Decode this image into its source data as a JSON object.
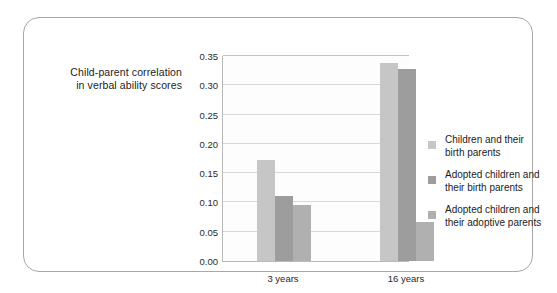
{
  "figure": {
    "background_color": "#ffffff",
    "frame_border_color": "#a8a8a8"
  },
  "axis_title": {
    "line1": "Child-parent correlation",
    "line2": "in verbal ability scores"
  },
  "chart_data": {
    "type": "bar",
    "title": "",
    "subtitle": "",
    "xlabel": "",
    "ylabel": "Child-parent correlation in verbal ability scores",
    "categories": [
      "3 years",
      "16 years"
    ],
    "ylim": [
      0.0,
      0.35
    ],
    "ytick_labels": [
      "0.35",
      "0.30",
      "0.25",
      "0.20",
      "0.15",
      "0.10",
      "0.05",
      "0.00"
    ],
    "ytick_values": [
      0.35,
      0.3,
      0.25,
      0.2,
      0.15,
      0.1,
      0.05,
      0.0
    ],
    "grid": true,
    "legend_position": "right",
    "series": [
      {
        "name": "Children and their birth parents",
        "name_line1": "Children and their",
        "name_line2": "birth parents",
        "color": "#c6c6c6",
        "values": [
          0.172,
          0.338
        ]
      },
      {
        "name": "Adopted children and their birth parents",
        "name_line1": "Adopted children and",
        "name_line2": "their birth parents",
        "color": "#9d9d9d",
        "values": [
          0.111,
          0.328
        ]
      },
      {
        "name": "Adopted children and their adoptive parents",
        "name_line1": "Adopted children and",
        "name_line2": "their adoptive parents",
        "color": "#b0b0b0",
        "values": [
          0.096,
          0.067
        ]
      }
    ]
  }
}
